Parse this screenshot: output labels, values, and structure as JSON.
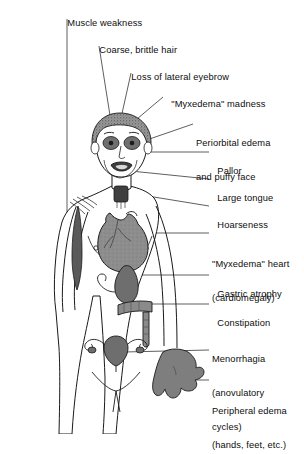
{
  "diagram": {
    "background_color": "#ffffff",
    "line_color": "#1a1a1a",
    "organ_shade_color": "#8a8a8a",
    "skin_fill_color": "#ffffff",
    "labels": [
      {
        "id": "muscle-weakness",
        "text": "Muscle weakness",
        "text2": "",
        "x": 62,
        "y": 7
      },
      {
        "id": "coarse-brittle-hair",
        "text": "Coarse, brittle hair",
        "text2": "",
        "x": 94,
        "y": 34
      },
      {
        "id": "loss-lateral-eyebrow",
        "text": "Loss of lateral eyebrow",
        "text2": "",
        "x": 126,
        "y": 61
      },
      {
        "id": "myxedema-madness",
        "text": "\"Myxedema\" madness",
        "text2": "",
        "x": 166,
        "y": 88
      },
      {
        "id": "periorbital-edema",
        "text": "Periorbital edema",
        "text2": "and puffy face",
        "x": 196,
        "y": 115
      },
      {
        "id": "pallor",
        "text": "Pallor",
        "text2": "",
        "x": 212,
        "y": 155
      },
      {
        "id": "large-tongue",
        "text": "Large tongue",
        "text2": "",
        "x": 212,
        "y": 182
      },
      {
        "id": "hoarseness",
        "text": "Hoarseness",
        "text2": "",
        "x": 212,
        "y": 209
      },
      {
        "id": "myxedema-heart",
        "text": "\"Myxedema\" heart",
        "text2": "(cardiomegaly)",
        "x": 212,
        "y": 236
      },
      {
        "id": "gastric-atrophy",
        "text": "Gastric atrophy",
        "text2": "",
        "x": 212,
        "y": 278
      },
      {
        "id": "constipation",
        "text": "Constipation",
        "text2": "",
        "x": 212,
        "y": 307
      },
      {
        "id": "menorrhagia",
        "text": "Menorrhagia",
        "text2": "(anovulatory",
        "text3": "cycles)",
        "x": 212,
        "y": 331
      },
      {
        "id": "peripheral-edema",
        "text": "Peripheral edema",
        "text2": "(hands, feet, etc.)",
        "x": 212,
        "y": 383
      }
    ],
    "organs": [
      {
        "id": "thyroid-larynx",
        "name": "thyroid / larynx",
        "shaded": true
      },
      {
        "id": "heart",
        "name": "enlarged heart (cardiomegaly)",
        "shaded": true
      },
      {
        "id": "stomach",
        "name": "atrophic stomach",
        "shaded": true
      },
      {
        "id": "colon",
        "name": "colon",
        "shaded": true
      },
      {
        "id": "uterus-ovaries",
        "name": "uterus and ovaries",
        "shaded": true
      },
      {
        "id": "hand",
        "name": "edematous hand",
        "shaded": true
      },
      {
        "id": "arm-muscle",
        "name": "exposed arm musculature",
        "shaded": true
      }
    ]
  }
}
